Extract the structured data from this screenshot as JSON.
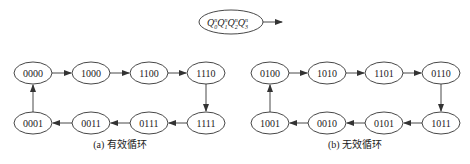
{
  "legend": {
    "label_parts": [
      {
        "base": "Q",
        "sup": "n",
        "sub": "0"
      },
      {
        "base": "Q",
        "sup": "n",
        "sub": "1"
      },
      {
        "base": "Q",
        "sup": "n",
        "sub": "2"
      },
      {
        "base": "Q",
        "sup": "n",
        "sub": "3"
      }
    ]
  },
  "diagram_a": {
    "caption": "(a) 有效循环",
    "top_row": [
      "0000",
      "1000",
      "1100",
      "1110"
    ],
    "bottom_row": [
      "0001",
      "0011",
      "0111",
      "1111"
    ]
  },
  "diagram_b": {
    "caption": "(b) 无效循环",
    "top_row": [
      "0100",
      "1010",
      "1101",
      "0110"
    ],
    "bottom_row": [
      "1001",
      "0010",
      "0101",
      "1011"
    ]
  },
  "colors": {
    "stroke": "#333333",
    "text": "#222222",
    "background": "#ffffff"
  }
}
